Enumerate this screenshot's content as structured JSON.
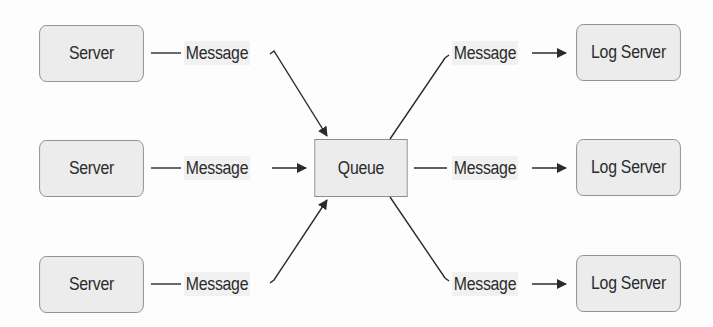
{
  "diagram": {
    "title": "",
    "sources": [
      {
        "label": "Server"
      },
      {
        "label": "Server"
      },
      {
        "label": "Server"
      }
    ],
    "hub": {
      "label": "Queue"
    },
    "targets": [
      {
        "label": "Log Server"
      },
      {
        "label": "Log Server"
      },
      {
        "label": "Log Server"
      }
    ],
    "edges_in": [
      {
        "label": "Message"
      },
      {
        "label": "Message"
      },
      {
        "label": "Message"
      }
    ],
    "edges_out": [
      {
        "label": "Message"
      },
      {
        "label": "Message"
      },
      {
        "label": "Message"
      }
    ],
    "colors": {
      "box_fill": "#ececec",
      "box_border": "#8c8c8c",
      "line": "#2b2b2b",
      "text": "#2b2b2b"
    }
  }
}
